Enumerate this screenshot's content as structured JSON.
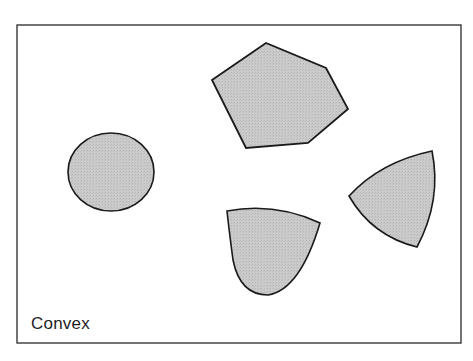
{
  "figure": {
    "caption": "Convex",
    "frame": {
      "x": 17,
      "y": 25,
      "width": 444,
      "height": 318,
      "stroke": "#2a2a2a"
    },
    "fill_color": "#c8c8c8",
    "stroke_color": "#1a1a1a",
    "shapes": [
      {
        "name": "circle",
        "type": "ellipse",
        "cx": 111,
        "cy": 172,
        "rx": 43,
        "ry": 39
      },
      {
        "name": "hexagon",
        "type": "polygon",
        "points": "212,80 266,43 326,68 348,109 308,143 246,148"
      },
      {
        "name": "teardrop",
        "type": "path",
        "d": "M227,211 Q275,202 320,223 Q300,290 268,295 Q240,295 233,260 Q229,230 227,211 Z"
      },
      {
        "name": "reuleaux-triangle",
        "type": "path",
        "d": "M349,196 Q380,162 432,151 Q442,200 417,247 Q372,236 349,196 Z"
      }
    ]
  }
}
